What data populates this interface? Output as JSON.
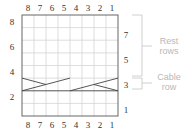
{
  "chart": {
    "columns": [
      "8",
      "7",
      "6",
      "5",
      "4",
      "3",
      "2",
      "1"
    ],
    "left_row_numbers": [
      "8",
      "6",
      "4",
      "2"
    ],
    "right_row_numbers": [
      "7",
      "5",
      "3",
      "1"
    ],
    "rows": 8,
    "cols": 8,
    "cable_row": 3
  },
  "legend": {
    "rest_rows_line1": "Rest",
    "rest_rows_line2": "rows",
    "cable_row_line1": "Cable",
    "cable_row_line2": "row"
  },
  "colors": {
    "grid": "#cfcfcf",
    "border": "#555555",
    "cable": "#444444",
    "label": "#b8b8b8"
  }
}
